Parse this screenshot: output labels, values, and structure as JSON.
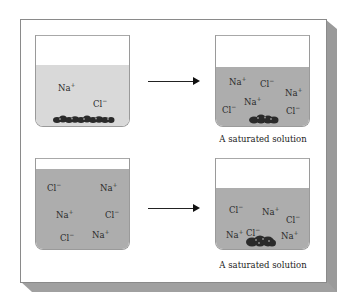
{
  "figure": {
    "colors": {
      "panel_background": "#ffffff",
      "panel_border": "#8a8a8a",
      "shadow": "#9c9c9c",
      "liquid_light": "#d9d9d9",
      "liquid_dark": "#adadad",
      "crystal": "#2b2b2b",
      "arrow": "#222222"
    },
    "rows": [
      {
        "left_beaker": {
          "liquid_shade": "light",
          "ions": [
            {
              "symbol": "Na",
              "charge": "+"
            },
            {
              "symbol": "Cl",
              "charge": "−"
            }
          ],
          "has_crystals": true,
          "crystal_amount": "large"
        },
        "arrow": "right-arrow",
        "right_beaker": {
          "liquid_shade": "dark",
          "ions": [
            {
              "symbol": "Na",
              "charge": "+"
            },
            {
              "symbol": "Cl",
              "charge": "−"
            },
            {
              "symbol": "Na",
              "charge": "+"
            },
            {
              "symbol": "Na",
              "charge": "+"
            },
            {
              "symbol": "Cl",
              "charge": "−"
            },
            {
              "symbol": "Cl",
              "charge": "−"
            }
          ],
          "has_crystals": true,
          "crystal_amount": "small",
          "caption": "A saturated solution"
        }
      },
      {
        "left_beaker": {
          "liquid_shade": "dark",
          "ions": [
            {
              "symbol": "Cl",
              "charge": "−"
            },
            {
              "symbol": "Na",
              "charge": "+"
            },
            {
              "symbol": "Na",
              "charge": "+"
            },
            {
              "symbol": "Cl",
              "charge": "−"
            },
            {
              "symbol": "Cl",
              "charge": "−"
            },
            {
              "symbol": "Na",
              "charge": "+"
            }
          ],
          "has_crystals": false
        },
        "arrow": "right-arrow",
        "right_beaker": {
          "liquid_shade": "dark",
          "ions": [
            {
              "symbol": "Cl",
              "charge": "−"
            },
            {
              "symbol": "Na",
              "charge": "+"
            },
            {
              "symbol": "Cl",
              "charge": "−"
            },
            {
              "symbol": "Na",
              "charge": "+"
            },
            {
              "symbol": "Cl",
              "charge": "−"
            },
            {
              "symbol": "Na",
              "charge": "+"
            }
          ],
          "has_crystals": true,
          "crystal_amount": "medium",
          "caption": "A saturated solution"
        }
      }
    ]
  }
}
